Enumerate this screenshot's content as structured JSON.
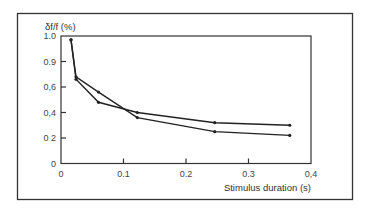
{
  "chart_data": {
    "type": "line",
    "title": "",
    "ylabel": "δf/f (%)",
    "xlabel": "Stimulus duration (s)",
    "xlim": [
      0,
      0.4
    ],
    "ylim": [
      0,
      1.0
    ],
    "x_ticks": [
      {
        "value": 0,
        "label": "0"
      },
      {
        "value": 0.1,
        "label": "0.1"
      },
      {
        "value": 0.2,
        "label": "0.2"
      },
      {
        "value": 0.3,
        "label": "0.3"
      },
      {
        "value": 0.4,
        "label": "0,4"
      }
    ],
    "y_ticks": [
      {
        "value": 0,
        "label": "0"
      },
      {
        "value": 0.2,
        "label": "0 2"
      },
      {
        "value": 0.4,
        "label": "0,4"
      },
      {
        "value": 0.6,
        "label": "0,6"
      },
      {
        "value": 0.8,
        "label": "0.9"
      },
      {
        "value": 1.0,
        "label": "1.0"
      }
    ],
    "grid": false,
    "legend": null,
    "series": [
      {
        "name": "Series 1",
        "x": [
          0.016,
          0.024,
          0.06,
          0.122,
          0.246,
          0.366
        ],
        "values": [
          0.97,
          0.68,
          0.56,
          0.36,
          0.25,
          0.22
        ]
      },
      {
        "name": "Series 2",
        "x": [
          0.016,
          0.024,
          0.06,
          0.122,
          0.246,
          0.366
        ],
        "values": [
          0.97,
          0.66,
          0.48,
          0.4,
          0.32,
          0.3
        ]
      }
    ]
  },
  "colors": {
    "line": "#222222",
    "frame": "#333333",
    "background": "#ffffff"
  }
}
